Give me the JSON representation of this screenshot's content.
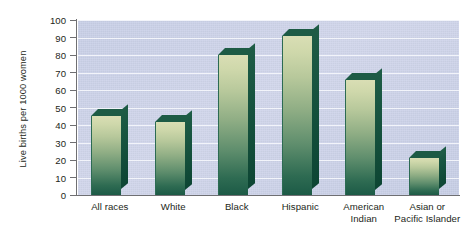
{
  "chart_data": {
    "type": "bar",
    "title": "",
    "xlabel": "",
    "ylabel": "Live births per 1000 women",
    "ylim": [
      0,
      100
    ],
    "yticks": [
      0,
      10,
      20,
      30,
      40,
      50,
      60,
      70,
      80,
      90,
      100
    ],
    "grid": true,
    "legend": null,
    "categories": [
      "All races",
      "White",
      "Black",
      "Hispanic",
      "American Indian",
      "Asian or Pacific Islander"
    ],
    "category_lines": [
      [
        "All races"
      ],
      [
        "White"
      ],
      [
        "Black"
      ],
      [
        "Hispanic"
      ],
      [
        "American",
        "Indian"
      ],
      [
        "Asian or",
        "Pacific Islander"
      ]
    ],
    "values": [
      45,
      42,
      80,
      91,
      66,
      21
    ],
    "series": [
      {
        "name": "Live births per 1000 women",
        "values": [
          45,
          42,
          80,
          91,
          66,
          21
        ]
      }
    ],
    "colors": {
      "plot_background": "#ccd3e9",
      "gridline": "#f2f4fa",
      "axis": "#6f6f72",
      "bar_face_light": "#d9deb4",
      "bar_face_dark": "#1c5a46",
      "bar_shadow": "#14503c",
      "text": "#231f20",
      "figure_background": "#ffffff"
    }
  }
}
